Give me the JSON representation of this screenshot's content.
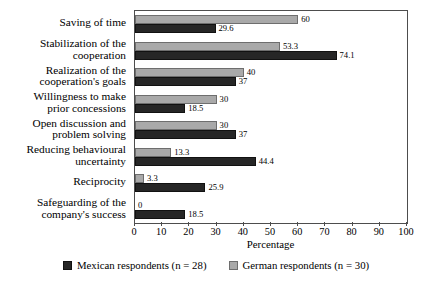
{
  "chart_data": {
    "type": "bar",
    "orientation": "horizontal",
    "title": "",
    "xlabel": "Percentage",
    "ylabel": "",
    "xlim": [
      0,
      100
    ],
    "xticks": [
      0,
      10,
      20,
      30,
      40,
      50,
      60,
      70,
      80,
      90,
      100
    ],
    "grid": false,
    "legend_position": "bottom",
    "categories": [
      "Saving of time",
      "Stabilization of the\ncooperation",
      "Realization of the\ncooperation's goals",
      "Willingness to make\nprior concessions",
      "Open discussion and\nproblem solving",
      "Reducing behavioural\nuncertainty",
      "Reciprocity",
      "Safeguarding of the\ncompany's success"
    ],
    "series": [
      {
        "name": "German respondents (n = 30)",
        "color": "#a9a9a9",
        "values": [
          60,
          53.3,
          40,
          30,
          30,
          13.3,
          3.3,
          0
        ],
        "labels": [
          "60",
          "53.3",
          "40",
          "30",
          "30",
          "13.3",
          "3.3",
          "0"
        ]
      },
      {
        "name": "Mexican respondents (n = 28)",
        "color": "#262626",
        "values": [
          29.6,
          74.1,
          37,
          18.5,
          37,
          44.4,
          25.9,
          18.5
        ],
        "labels": [
          "29.6",
          "74.1",
          "37",
          "18.5",
          "37",
          "44.4",
          "25.9",
          "18.5"
        ]
      }
    ]
  },
  "legend": {
    "items": [
      {
        "label": "Mexican respondents (n = 28)",
        "key": "mexican"
      },
      {
        "label": "German respondents (n = 30)",
        "key": "german"
      }
    ]
  }
}
